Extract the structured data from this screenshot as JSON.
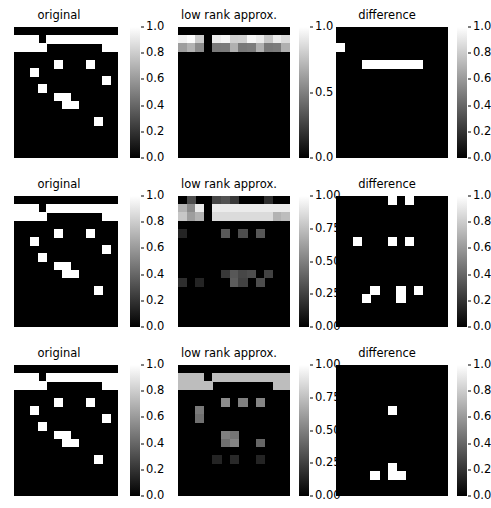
{
  "figure": {
    "rows": 3,
    "cols": 3,
    "width": 488,
    "height": 508,
    "background": "#ffffff",
    "cmap": "gray",
    "cmap_low": "#000000",
    "cmap_high": "#ffffff"
  },
  "titles": {
    "original": "original",
    "low_rank": "low rank approx.",
    "difference": "difference"
  },
  "colorbars": {
    "original_ticks": [
      "1.0",
      "0.8",
      "0.6",
      "0.4",
      "0.2",
      "0.0"
    ],
    "lowrank_r1_ticks": [
      "1.0",
      "0.5",
      "0.0"
    ],
    "lowrank_r2_ticks": [
      "1.00",
      "0.75",
      "0.50",
      "0.25",
      "0.00"
    ],
    "lowrank_r3_ticks": [
      "1.00",
      "0.75",
      "0.50",
      "0.25",
      "0.00"
    ],
    "difference_ticks": [
      "1.0",
      "0.8",
      "0.6",
      "0.4",
      "0.2",
      "0.0"
    ]
  },
  "chart_data": {
    "type": "heatmap",
    "title": "",
    "xlabel": "",
    "ylabel": "",
    "grid": false,
    "legend_position": "right-colorbar",
    "matrix_shape": [
      16,
      13
    ],
    "panels": [
      {
        "row": 1,
        "col": 1,
        "title": "original",
        "vmin": 0.0,
        "vmax": 1.0,
        "ticks": [
          0.0,
          0.2,
          0.4,
          0.6,
          0.8,
          1.0
        ],
        "description": "binary 0/1 sparse matrix with two bright structured rows near the top and scattered single bright cells below"
      },
      {
        "row": 1,
        "col": 2,
        "title": "low rank approx.",
        "vmin": 0.0,
        "vmax": 1.1,
        "ticks": [
          0.0,
          0.5,
          1.0
        ],
        "description": "rank-1 reconstruction: only the two bright horizontal bands survive, rest near zero"
      },
      {
        "row": 1,
        "col": 3,
        "title": "difference",
        "vmin": 0.0,
        "vmax": 1.0,
        "ticks": [
          0.0,
          0.2,
          0.4,
          0.6,
          0.8,
          1.0
        ],
        "description": "residual: one small cell top-left and one wide horizontal bar"
      },
      {
        "row": 2,
        "col": 1,
        "title": "original",
        "vmin": 0.0,
        "vmax": 1.0,
        "ticks": [
          0.0,
          0.2,
          0.4,
          0.6,
          0.8,
          1.0
        ],
        "description": "same binary input matrix"
      },
      {
        "row": 2,
        "col": 2,
        "title": "low rank approx.",
        "vmin": 0.0,
        "vmax": 1.05,
        "ticks": [
          0.0,
          0.25,
          0.5,
          0.75,
          1.0
        ],
        "description": "higher rank reconstruction: bands plus faint reproduction of scattered cells"
      },
      {
        "row": 2,
        "col": 3,
        "title": "difference",
        "vmin": 0.0,
        "vmax": 1.0,
        "ticks": [
          0.0,
          0.2,
          0.4,
          0.6,
          0.8,
          1.0
        ],
        "description": "residual: roughly ten scattered bright cells remaining"
      },
      {
        "row": 3,
        "col": 1,
        "title": "original",
        "vmin": 0.0,
        "vmax": 1.0,
        "ticks": [
          0.0,
          0.2,
          0.4,
          0.6,
          0.8,
          1.0
        ],
        "description": "same binary input matrix"
      },
      {
        "row": 3,
        "col": 2,
        "title": "low rank approx.",
        "vmin": 0.0,
        "vmax": 1.05,
        "ticks": [
          0.0,
          0.25,
          0.5,
          0.75,
          1.0
        ],
        "description": "near-full-rank reconstruction: most structure recovered"
      },
      {
        "row": 3,
        "col": 3,
        "title": "difference",
        "vmin": 0.0,
        "vmax": 1.0,
        "ticks": [
          0.0,
          0.2,
          0.4,
          0.6,
          0.8,
          1.0
        ],
        "description": "residual: four remaining bright cells"
      }
    ],
    "original_bright_cells": [
      [
        1,
        0
      ],
      [
        1,
        1
      ],
      [
        1,
        2
      ],
      [
        1,
        3
      ],
      [
        1,
        4
      ],
      [
        1,
        5
      ],
      [
        1,
        6
      ],
      [
        1,
        7
      ],
      [
        1,
        8
      ],
      [
        1,
        9
      ],
      [
        1,
        10
      ],
      [
        1,
        11
      ],
      [
        1,
        12
      ],
      [
        2,
        0
      ],
      [
        2,
        1
      ],
      [
        2,
        2
      ],
      [
        2,
        3
      ],
      [
        2,
        4
      ],
      [
        2,
        5
      ],
      [
        2,
        6
      ],
      [
        2,
        7
      ],
      [
        2,
        8
      ],
      [
        2,
        9
      ],
      [
        2,
        10
      ],
      [
        2,
        11
      ],
      [
        2,
        12
      ],
      [
        4,
        5
      ],
      [
        4,
        9
      ],
      [
        5,
        2
      ],
      [
        6,
        11
      ],
      [
        7,
        3
      ],
      [
        8,
        5
      ],
      [
        8,
        6
      ],
      [
        9,
        6
      ],
      [
        9,
        7
      ],
      [
        11,
        10
      ]
    ]
  }
}
